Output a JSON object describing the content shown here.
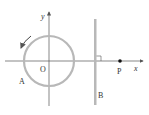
{
  "diagram": {
    "labels": {
      "y_axis": "y",
      "x_axis": "x",
      "origin": "O",
      "ring": "A",
      "plate": "B",
      "point": "P"
    },
    "colors": {
      "axis": "#555555",
      "ring": "#b8b8b8",
      "plate": "#b8b8b8",
      "point": "#111111",
      "text": "#333333"
    },
    "elements": {
      "rotation_arrow": "counterclockwise-arrow",
      "right_angle_marker": "right-angle-icon"
    }
  }
}
